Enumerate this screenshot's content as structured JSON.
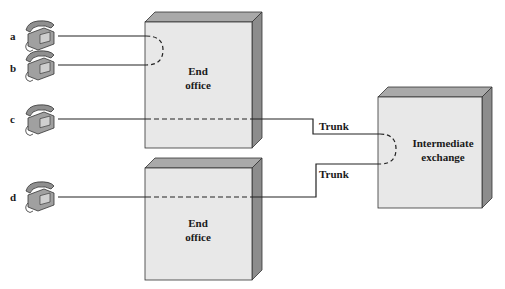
{
  "diagram": {
    "subscribers": [
      {
        "id": "a",
        "label": "a"
      },
      {
        "id": "b",
        "label": "b"
      },
      {
        "id": "c",
        "label": "c"
      },
      {
        "id": "d",
        "label": "d"
      }
    ],
    "nodes": {
      "end_office_top": {
        "line1": "End",
        "line2": "office"
      },
      "end_office_bottom": {
        "line1": "End",
        "line2": "office"
      },
      "intermediate_exchange": {
        "line1": "Intermediate",
        "line2": "exchange"
      }
    },
    "links": {
      "trunk_top": "Trunk",
      "trunk_bottom": "Trunk"
    },
    "colors": {
      "box_face": "#e8e8e8",
      "box_top": "#a9a9a9",
      "box_side": "#8c8c8c",
      "line": "#222222",
      "phone": "#9a9a9a"
    }
  }
}
